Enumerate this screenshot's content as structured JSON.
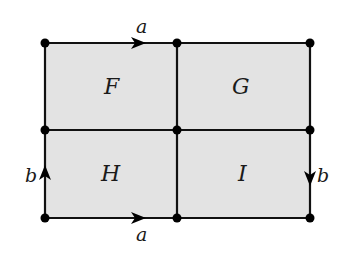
{
  "diagram": {
    "colors": {
      "fill": "#e3e3e3",
      "stroke": "#111111",
      "vertex": "#000000"
    },
    "grid": {
      "x": [
        45,
        177,
        310
      ],
      "y": [
        43,
        130,
        218
      ]
    },
    "faces": [
      {
        "id": "F",
        "label": "F",
        "row": 0,
        "col": 0
      },
      {
        "id": "G",
        "label": "G",
        "row": 0,
        "col": 1
      },
      {
        "id": "H",
        "label": "H",
        "row": 1,
        "col": 0
      },
      {
        "id": "I",
        "label": "I",
        "row": 1,
        "col": 1
      }
    ],
    "edge_labels": {
      "top_a": "a",
      "bottom_a": "a",
      "left_b": "b",
      "right_b": "b"
    },
    "arrows": [
      {
        "edge": "top-left",
        "direction": "right",
        "label": "a"
      },
      {
        "edge": "bottom-left",
        "direction": "right",
        "label": "a"
      },
      {
        "edge": "left-bottom",
        "direction": "up",
        "label": "b"
      },
      {
        "edge": "right-bottom",
        "direction": "down",
        "label": "b"
      }
    ],
    "vertex_count": 9
  }
}
